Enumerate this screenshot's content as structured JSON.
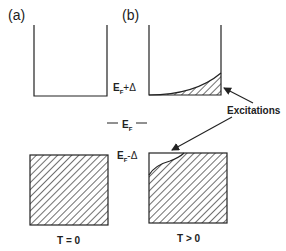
{
  "panels": {
    "a": {
      "label": "(a)"
    },
    "b": {
      "label": "(b)"
    }
  },
  "energy_labels": {
    "upper_main": "E",
    "upper_sub": "F",
    "upper_suffix": "+Δ",
    "mid_main": "E",
    "mid_sub": "F",
    "lower_main": "E",
    "lower_sub": "F",
    "lower_suffix": "-Δ"
  },
  "annotation": {
    "text": "Excitations"
  },
  "temperature_labels": {
    "left": "T = 0",
    "right": "T > 0"
  },
  "colors": {
    "ink": "#222222",
    "background": "#ffffff"
  }
}
